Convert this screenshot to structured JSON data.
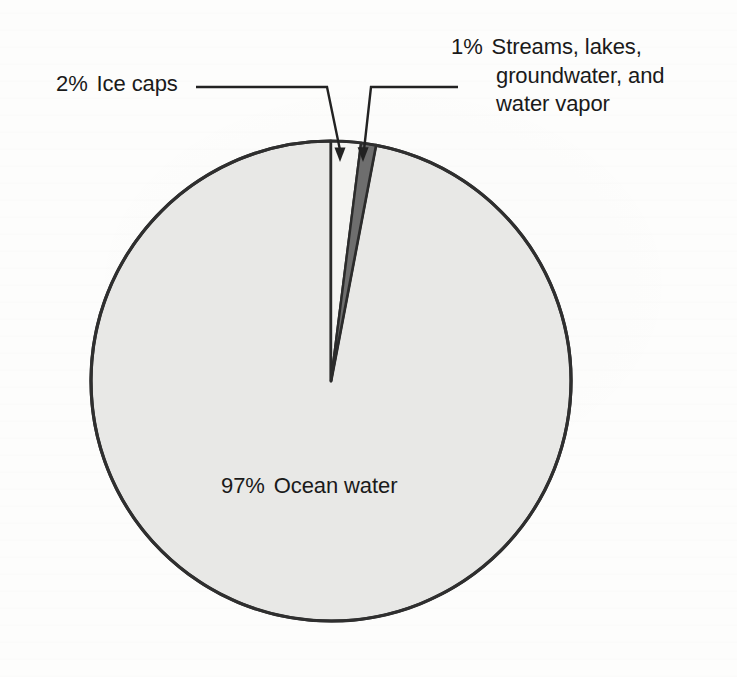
{
  "chart_data": {
    "type": "pie",
    "title": "",
    "subtitle": "",
    "xlabel": "",
    "ylabel": "",
    "grid": false,
    "legend_position": "callout-labels",
    "units": "percent",
    "start_angle_deg": 0,
    "direction": "clockwise",
    "categories": [
      "Ocean water",
      "Ice caps",
      "Streams, lakes, groundwater, and water vapor"
    ],
    "values": [
      97,
      2,
      1
    ],
    "slices": [
      {
        "label": "Ocean water",
        "value": 97,
        "percent_text": "97%",
        "color": "#e8e8e6",
        "stroke": "#2b2b2b",
        "label_placement": "inside",
        "start_angle_deg": 10.8,
        "end_angle_deg": 360
      },
      {
        "label": "Ice caps",
        "value": 2,
        "percent_text": "2%",
        "color": "#f4f4f2",
        "stroke": "#2b2b2b",
        "label_placement": "callout-left",
        "start_angle_deg": 0,
        "end_angle_deg": 7.2
      },
      {
        "label": "Streams, lakes, groundwater, and water vapor",
        "value": 1,
        "percent_text": "1%",
        "color": "#6e6e6e",
        "stroke": "#2b2b2b",
        "label_placement": "callout-right",
        "start_angle_deg": 7.2,
        "end_angle_deg": 10.8
      }
    ]
  },
  "labels": {
    "ice_caps": {
      "percent": "2%",
      "text": "Ice caps"
    },
    "streams": {
      "percent": "1%",
      "line1": "Streams, lakes,",
      "line2": "groundwater, and",
      "line3": "water vapor"
    },
    "ocean": {
      "percent": "97%",
      "text": "Ocean water"
    }
  },
  "colors": {
    "background": "#fdfdfc",
    "ocean_slice": "#e8e8e6",
    "ice_caps_slice": "#f4f4f2",
    "streams_slice": "#6e6e6e",
    "outline": "#2b2b2b",
    "text": "#1a1a1a",
    "leader_line": "#222222"
  }
}
